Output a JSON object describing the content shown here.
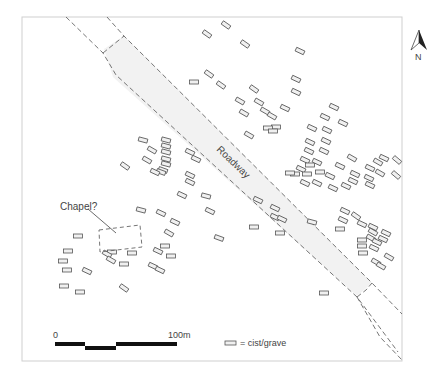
{
  "map": {
    "frame": {
      "x": 22,
      "y": 17,
      "w": 380,
      "h": 344,
      "stroke": "#cfcfcf"
    },
    "colors": {
      "grave_stroke": "#555555",
      "grave_fill": "#f0f0f0",
      "road_fill": "#f3f3f3",
      "dash": "#666666",
      "text": "#444444",
      "bar": "#111111"
    },
    "road_label": "Roadway",
    "chapel_label": "Chapel?",
    "north_label": "N",
    "scale": {
      "start_label": "0",
      "end_label": "100m"
    },
    "legend": {
      "label": "= cist/grave"
    },
    "graves": [
      [
        207,
        34,
        35
      ],
      [
        226,
        25,
        35
      ],
      [
        245,
        44,
        35
      ],
      [
        300,
        51,
        25
      ],
      [
        194,
        82,
        0
      ],
      [
        209,
        74,
        35
      ],
      [
        221,
        85,
        35
      ],
      [
        254,
        89,
        35
      ],
      [
        296,
        79,
        25
      ],
      [
        296,
        92,
        25
      ],
      [
        240,
        101,
        30
      ],
      [
        259,
        102,
        30
      ],
      [
        265,
        111,
        30
      ],
      [
        244,
        113,
        30
      ],
      [
        285,
        108,
        25
      ],
      [
        272,
        116,
        30
      ],
      [
        276,
        127,
        0
      ],
      [
        249,
        135,
        30
      ],
      [
        268,
        128,
        0
      ],
      [
        273,
        131,
        0
      ],
      [
        334,
        107,
        25
      ],
      [
        325,
        117,
        25
      ],
      [
        343,
        123,
        25
      ],
      [
        312,
        128,
        25
      ],
      [
        327,
        130,
        25
      ],
      [
        310,
        142,
        25
      ],
      [
        326,
        141,
        25
      ],
      [
        309,
        151,
        25
      ],
      [
        324,
        151,
        25
      ],
      [
        305,
        160,
        25
      ],
      [
        310,
        165,
        0
      ],
      [
        301,
        169,
        25
      ],
      [
        317,
        162,
        25
      ],
      [
        295,
        174,
        0
      ],
      [
        307,
        174,
        0
      ],
      [
        290,
        173,
        0
      ],
      [
        305,
        183,
        25
      ],
      [
        317,
        183,
        25
      ],
      [
        340,
        166,
        25
      ],
      [
        352,
        158,
        30
      ],
      [
        355,
        174,
        25
      ],
      [
        369,
        178,
        25
      ],
      [
        353,
        181,
        25
      ],
      [
        370,
        168,
        25
      ],
      [
        384,
        158,
        25
      ],
      [
        378,
        162,
        30
      ],
      [
        380,
        173,
        30
      ],
      [
        397,
        160,
        40
      ],
      [
        396,
        175,
        40
      ],
      [
        370,
        185,
        25
      ],
      [
        346,
        186,
        25
      ],
      [
        333,
        188,
        25
      ],
      [
        330,
        176,
        25
      ],
      [
        320,
        172,
        0
      ],
      [
        143,
        140,
        15
      ],
      [
        166,
        140,
        15
      ],
      [
        166,
        146,
        15
      ],
      [
        152,
        150,
        30
      ],
      [
        166,
        152,
        15
      ],
      [
        166,
        159,
        15
      ],
      [
        147,
        160,
        30
      ],
      [
        166,
        164,
        15
      ],
      [
        163,
        170,
        20
      ],
      [
        161,
        172,
        20
      ],
      [
        155,
        172,
        25
      ],
      [
        125,
        166,
        35
      ],
      [
        190,
        152,
        25
      ],
      [
        196,
        159,
        25
      ],
      [
        190,
        175,
        25
      ],
      [
        190,
        182,
        25
      ],
      [
        182,
        195,
        25
      ],
      [
        206,
        196,
        15
      ],
      [
        210,
        211,
        25
      ],
      [
        141,
        210,
        15
      ],
      [
        258,
        200,
        25
      ],
      [
        275,
        208,
        25
      ],
      [
        275,
        217,
        25
      ],
      [
        282,
        219,
        25
      ],
      [
        280,
        233,
        0
      ],
      [
        312,
        222,
        15
      ],
      [
        254,
        227,
        0
      ],
      [
        219,
        238,
        20
      ],
      [
        161,
        213,
        25
      ],
      [
        175,
        222,
        25
      ],
      [
        169,
        233,
        30
      ],
      [
        165,
        246,
        0
      ],
      [
        171,
        256,
        0
      ],
      [
        158,
        251,
        25
      ],
      [
        153,
        266,
        25
      ],
      [
        160,
        270,
        25
      ],
      [
        124,
        288,
        35
      ],
      [
        112,
        252,
        0
      ],
      [
        124,
        264,
        0
      ],
      [
        78,
        236,
        0
      ],
      [
        68,
        251,
        0
      ],
      [
        63,
        261,
        0
      ],
      [
        67,
        270,
        0
      ],
      [
        64,
        286,
        0
      ],
      [
        80,
        292,
        0
      ],
      [
        87,
        271,
        25
      ],
      [
        107,
        254,
        30
      ],
      [
        111,
        260,
        30
      ],
      [
        132,
        253,
        0
      ],
      [
        345,
        211,
        25
      ],
      [
        356,
        216,
        35
      ],
      [
        343,
        220,
        25
      ],
      [
        362,
        224,
        25
      ],
      [
        340,
        229,
        0
      ],
      [
        373,
        227,
        25
      ],
      [
        373,
        232,
        30
      ],
      [
        371,
        238,
        30
      ],
      [
        362,
        240,
        0
      ],
      [
        362,
        246,
        0
      ],
      [
        363,
        253,
        0
      ],
      [
        383,
        239,
        25
      ],
      [
        386,
        233,
        25
      ],
      [
        377,
        242,
        25
      ],
      [
        374,
        248,
        25
      ],
      [
        389,
        257,
        30
      ],
      [
        376,
        262,
        30
      ],
      [
        381,
        266,
        30
      ],
      [
        324,
        293,
        0
      ]
    ]
  }
}
